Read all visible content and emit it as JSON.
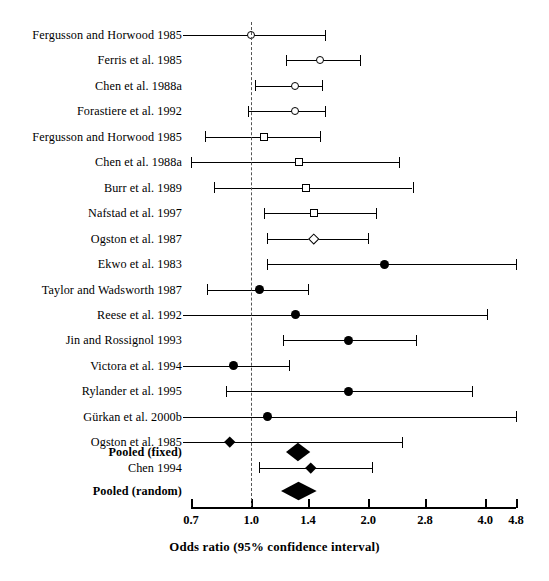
{
  "chart_data": {
    "type": "forest",
    "title": "",
    "xlabel": "Odds ratio (95% confidence interval)",
    "ylabel": "",
    "scale": "log",
    "xlim": [
      0.7,
      4.8
    ],
    "null_value": 1.0,
    "grid": false,
    "legend": "none",
    "ticks": [
      "0.7",
      "1.0",
      "1.4",
      "2.0",
      "2.8",
      "4.0",
      "4.8"
    ],
    "tick_values": [
      0.7,
      1.0,
      1.4,
      2.0,
      2.8,
      4.0,
      4.8
    ],
    "studies": [
      {
        "label": "Fergusson and Horwood 1985",
        "or": 1.0,
        "low": 0.55,
        "high": 1.55,
        "marker": "circle-open",
        "low_truncated": true,
        "high_truncated": false
      },
      {
        "label": "Ferris et al. 1985",
        "or": 1.5,
        "low": 1.23,
        "high": 1.9,
        "marker": "circle-open",
        "low_truncated": false,
        "high_truncated": false
      },
      {
        "label": "Chen et al. 1988a",
        "or": 1.3,
        "low": 1.02,
        "high": 1.52,
        "marker": "circle-open",
        "low_truncated": false,
        "high_truncated": false
      },
      {
        "label": "Forastiere et al. 1992",
        "or": 1.3,
        "low": 0.98,
        "high": 1.55,
        "marker": "circle-open",
        "low_truncated": false,
        "high_truncated": false
      },
      {
        "label": "Fergusson and Horwood 1985",
        "or": 1.08,
        "low": 0.76,
        "high": 1.5,
        "marker": "square-open",
        "low_truncated": false,
        "high_truncated": false
      },
      {
        "label": "Chen et al. 1988a",
        "or": 1.33,
        "low": 0.7,
        "high": 2.4,
        "marker": "square-open",
        "low_truncated": false,
        "high_truncated": false
      },
      {
        "label": "Burr et al. 1989",
        "or": 1.38,
        "low": 0.8,
        "high": 2.6,
        "marker": "square-open",
        "low_truncated": false,
        "high_truncated": false
      },
      {
        "label": "Nafstad et al. 1997",
        "or": 1.45,
        "low": 1.08,
        "high": 2.1,
        "marker": "square-open",
        "low_truncated": false,
        "high_truncated": false
      },
      {
        "label": "Ogston et al. 1987",
        "or": 1.45,
        "low": 1.1,
        "high": 2.0,
        "marker": "diamond-open",
        "low_truncated": false,
        "high_truncated": false
      },
      {
        "label": "Ekwo et al. 1983",
        "or": 2.2,
        "low": 1.1,
        "high": 4.8,
        "marker": "circle-filled",
        "low_truncated": false,
        "high_truncated": false
      },
      {
        "label": "Taylor and Wadsworth 1987",
        "or": 1.05,
        "low": 0.77,
        "high": 1.4,
        "marker": "circle-filled",
        "low_truncated": false,
        "high_truncated": false
      },
      {
        "label": "Reese et al. 1992",
        "or": 1.3,
        "low": 0.6,
        "high": 4.05,
        "marker": "circle-filled",
        "low_truncated": true,
        "high_truncated": false
      },
      {
        "label": "Jin and Rossignol 1993",
        "or": 1.78,
        "low": 1.21,
        "high": 2.65,
        "marker": "circle-filled",
        "low_truncated": false,
        "high_truncated": false
      },
      {
        "label": "Victora et al. 1994",
        "or": 0.9,
        "low": 0.58,
        "high": 1.25,
        "marker": "circle-filled",
        "low_truncated": true,
        "high_truncated": false
      },
      {
        "label": "Rylander et al. 1995",
        "or": 1.78,
        "low": 0.86,
        "high": 3.7,
        "marker": "circle-filled",
        "low_truncated": false,
        "high_truncated": false
      },
      {
        "label": "Gürkan et al. 2000b",
        "or": 1.1,
        "low": 0.58,
        "high": 4.8,
        "marker": "circle-filled",
        "low_truncated": true,
        "high_truncated": false
      },
      {
        "label": "Ogston et al. 1985",
        "or": 0.88,
        "low": 0.58,
        "high": 2.45,
        "marker": "diamond-filled",
        "low_truncated": true,
        "high_truncated": false
      },
      {
        "label": "Chen 1994",
        "or": 1.42,
        "low": 1.05,
        "high": 2.05,
        "marker": "diamond-filled",
        "low_truncated": false,
        "high_truncated": false
      }
    ],
    "pooled": [
      {
        "label": "Pooled (fixed)",
        "or": 1.32,
        "low": 1.23,
        "high": 1.42
      },
      {
        "label": "Pooled (random)",
        "or": 1.32,
        "low": 1.19,
        "high": 1.47
      }
    ]
  },
  "colors": {
    "marker": "#000000",
    "line": "#000000",
    "null_line": "#555555",
    "background": "#ffffff"
  }
}
